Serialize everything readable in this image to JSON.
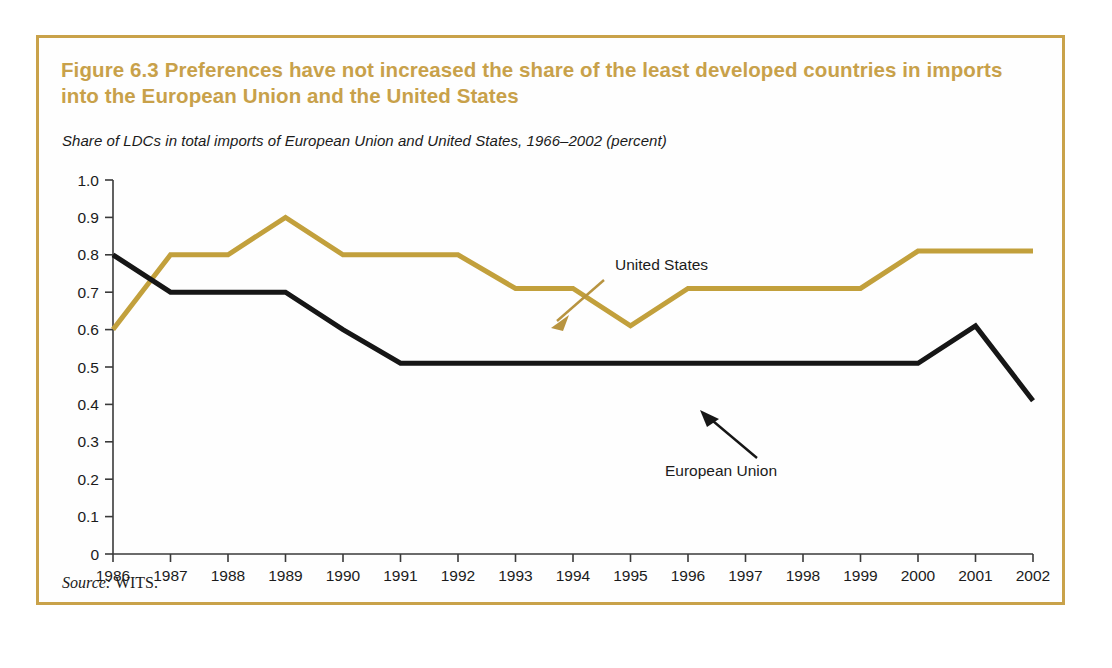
{
  "figure": {
    "title": "Figure 6.3  Preferences have not increased the share of the least developed countries in imports into the European Union and the United States",
    "subtitle": "Share of LDCs in total imports of European Union and United States, 1966–2002 (percent)",
    "source_label": "Source:",
    "source_value": " WITS.",
    "border_color": "#c9a24a",
    "title_color": "#c8a14a"
  },
  "chart_data": {
    "type": "line",
    "title": "Figure 6.3  Preferences have not increased the share of the least developed countries in imports into the European Union and the United States",
    "subtitle": "Share of LDCs in total imports of European Union and United States, 1966–2002 (percent)",
    "xlabel": "",
    "ylabel": "",
    "ylim": [
      0,
      1.0
    ],
    "ytick_labels": [
      "1.0",
      "0.9",
      "0.8",
      "0.7",
      "0.6",
      "0.5",
      "0.4",
      "0.3",
      "0.2",
      "0.1",
      "0"
    ],
    "ytick_values": [
      1.0,
      0.9,
      0.8,
      0.7,
      0.6,
      0.5,
      0.4,
      0.3,
      0.2,
      0.1,
      0
    ],
    "grid": false,
    "legend_position": "inline-annotations",
    "categories": [
      "1986",
      "1987",
      "1988",
      "1989",
      "1990",
      "1991",
      "1992",
      "1993",
      "1994",
      "1995",
      "1996",
      "1997",
      "1998",
      "1999",
      "2000",
      "2001",
      "2002"
    ],
    "x": [
      1986,
      1987,
      1988,
      1989,
      1990,
      1991,
      1992,
      1993,
      1994,
      1995,
      1996,
      1997,
      1998,
      1999,
      2000,
      2001,
      2002
    ],
    "series": [
      {
        "name": "United States",
        "color": "#c2a03c",
        "values": [
          0.6,
          0.8,
          0.8,
          0.9,
          0.8,
          0.8,
          0.8,
          0.71,
          0.71,
          0.61,
          0.71,
          0.71,
          0.71,
          0.71,
          0.81,
          0.81,
          0.81
        ]
      },
      {
        "name": "European Union",
        "color": "#161616",
        "values": [
          0.8,
          0.7,
          0.7,
          0.7,
          0.6,
          0.51,
          0.51,
          0.51,
          0.51,
          0.51,
          0.51,
          0.51,
          0.51,
          0.51,
          0.51,
          0.61,
          0.41
        ]
      }
    ],
    "annotations": [
      {
        "text": "United States",
        "color": "#1b1b1b",
        "arrow_color": "#b89440"
      },
      {
        "text": "European Union",
        "color": "#1b1b1b",
        "arrow_color": "#161616"
      }
    ]
  }
}
